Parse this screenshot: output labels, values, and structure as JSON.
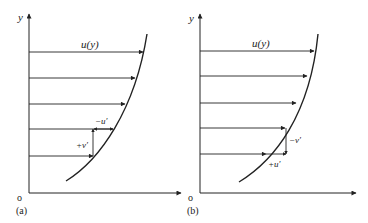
{
  "panels": [
    {
      "id": "a",
      "caption": "(a)",
      "origin_label": "o",
      "y_axis_label": "y",
      "profile_label": "u(y)",
      "fluctuation_labels": {
        "u": "−u′",
        "v": "+v′"
      }
    },
    {
      "id": "b",
      "caption": "(b)",
      "origin_label": "o",
      "y_axis_label": "y",
      "profile_label": "u(y)",
      "fluctuation_labels": {
        "u": "+u′",
        "v": "−v′"
      }
    }
  ],
  "colors": {
    "line": "#222222",
    "background": "#ffffff"
  }
}
